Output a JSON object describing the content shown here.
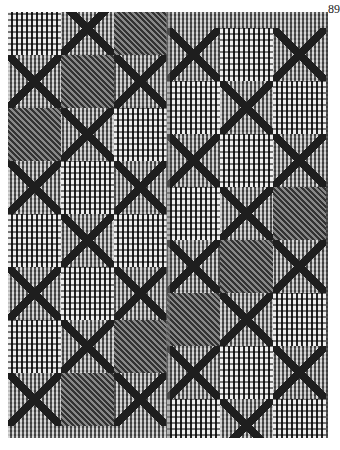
{
  "page": {
    "page_number": "89"
  },
  "image": {
    "subject": "black-and-white photograph of a woven coverlet with overshot pattern of circles, crosses and table blocks",
    "colors": {
      "background": "#ffffff",
      "dark_thread": "#1e1e1e",
      "light_thread": "#eeeeee",
      "mid_gray": "#8a8a8a"
    }
  }
}
